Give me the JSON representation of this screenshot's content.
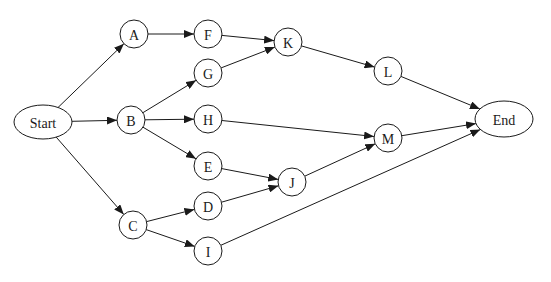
{
  "diagram": {
    "type": "directed-network",
    "stroke_color": "#1a1a1a",
    "background": "#ffffff",
    "nodes": [
      {
        "id": "Start",
        "label": "Start",
        "shape": "ellipse",
        "x": 43,
        "y": 122,
        "rx": 29,
        "ry": 17
      },
      {
        "id": "A",
        "label": "A",
        "shape": "circle",
        "x": 134,
        "y": 34,
        "r": 14
      },
      {
        "id": "B",
        "label": "B",
        "shape": "circle",
        "x": 131,
        "y": 120,
        "r": 14
      },
      {
        "id": "C",
        "label": "C",
        "shape": "circle",
        "x": 133,
        "y": 225,
        "r": 14
      },
      {
        "id": "F",
        "label": "F",
        "shape": "circle",
        "x": 208,
        "y": 34,
        "r": 14
      },
      {
        "id": "G",
        "label": "G",
        "shape": "circle",
        "x": 208,
        "y": 73,
        "r": 14
      },
      {
        "id": "H",
        "label": "H",
        "shape": "circle",
        "x": 208,
        "y": 119,
        "r": 14
      },
      {
        "id": "E",
        "label": "E",
        "shape": "circle",
        "x": 208,
        "y": 166,
        "r": 14
      },
      {
        "id": "D",
        "label": "D",
        "shape": "circle",
        "x": 208,
        "y": 206,
        "r": 14
      },
      {
        "id": "I",
        "label": "I",
        "shape": "circle",
        "x": 208,
        "y": 251,
        "r": 14
      },
      {
        "id": "K",
        "label": "K",
        "shape": "circle",
        "x": 288,
        "y": 42,
        "r": 14
      },
      {
        "id": "J",
        "label": "J",
        "shape": "circle",
        "x": 292,
        "y": 182,
        "r": 14
      },
      {
        "id": "L",
        "label": "L",
        "shape": "circle",
        "x": 388,
        "y": 71,
        "r": 14
      },
      {
        "id": "M",
        "label": "M",
        "shape": "circle",
        "x": 388,
        "y": 138,
        "r": 14
      },
      {
        "id": "End",
        "label": "End",
        "shape": "ellipse",
        "x": 504,
        "y": 119,
        "rx": 29,
        "ry": 18
      }
    ],
    "edges": [
      {
        "from": "Start",
        "to": "A"
      },
      {
        "from": "Start",
        "to": "B"
      },
      {
        "from": "Start",
        "to": "C"
      },
      {
        "from": "A",
        "to": "F"
      },
      {
        "from": "B",
        "to": "G"
      },
      {
        "from": "B",
        "to": "H"
      },
      {
        "from": "B",
        "to": "E"
      },
      {
        "from": "C",
        "to": "D"
      },
      {
        "from": "C",
        "to": "I"
      },
      {
        "from": "F",
        "to": "K"
      },
      {
        "from": "G",
        "to": "K"
      },
      {
        "from": "K",
        "to": "L"
      },
      {
        "from": "L",
        "to": "End"
      },
      {
        "from": "H",
        "to": "M"
      },
      {
        "from": "E",
        "to": "J"
      },
      {
        "from": "D",
        "to": "J"
      },
      {
        "from": "J",
        "to": "M"
      },
      {
        "from": "M",
        "to": "End"
      },
      {
        "from": "I",
        "to": "End"
      }
    ]
  }
}
